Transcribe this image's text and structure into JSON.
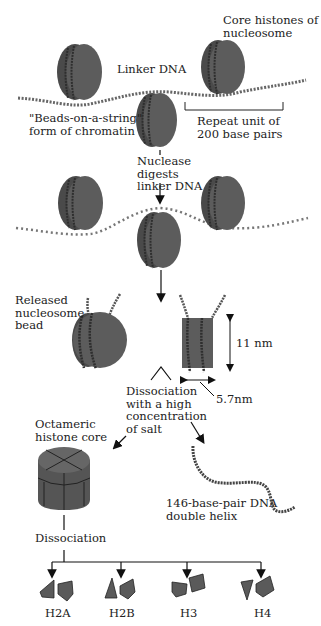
{
  "colors": {
    "histone_fill": "#5c5c5c",
    "histone_dark": "#3e3e3e",
    "histone_light": "#777777",
    "dna": "#555555",
    "text": "#222222",
    "background": "#ffffff"
  },
  "labels": {
    "core_histones": "Core histones of\nnucleosome",
    "linker_dna": "Linker DNA",
    "beads_on_string": "\"Beads-on-a-string\"\nform of chromatin",
    "repeat_unit": "Repeat unit of\n200 base pairs",
    "nuclease": "Nuclease\ndigests\nlinker DNA",
    "released_bead": "Released\nnucleosome\nbead",
    "height_dim": "11 nm",
    "width_dim": "5.7nm",
    "salt_dissociation": "Dissociation\nwith a high\nconcentration\nof salt",
    "octameric_core": "Octameric\nhistone core",
    "dna_helix": "146-base-pair DNA\ndouble helix",
    "dissociation": "Dissociation"
  },
  "histones": [
    {
      "label": "H2A"
    },
    {
      "label": "H2B"
    },
    {
      "label": "H3"
    },
    {
      "label": "H4"
    }
  ]
}
